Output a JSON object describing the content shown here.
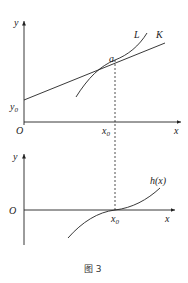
{
  "figure": {
    "caption": "图 3",
    "top_graph": {
      "y_axis_label": "y",
      "x_axis_label": "x",
      "origin_label": "O",
      "y_intercept_label": "y",
      "y_intercept_sub": "0",
      "x0_label": "x",
      "x0_sub": "0",
      "point_label": "a",
      "curve_L_label": "L",
      "line_K_label": "K"
    },
    "bottom_graph": {
      "y_axis_label": "y",
      "x_axis_label": "x",
      "origin_label": "O",
      "x0_label": "x",
      "x0_sub": "0",
      "curve_label": "h(x)"
    }
  }
}
